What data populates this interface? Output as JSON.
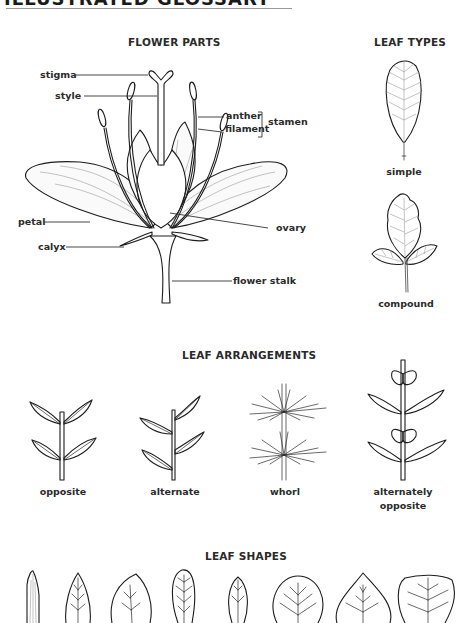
{
  "header": {
    "title": "ILLUSTRATED GLOSSARY"
  },
  "flower_parts": {
    "title": "FLOWER PARTS",
    "labels": {
      "stigma": "stigma",
      "style": "style",
      "anther": "anther",
      "filament": "filament",
      "stamen": "stamen",
      "petal": "petal",
      "ovary": "ovary",
      "calyx": "calyx",
      "flower_stalk": "flower stalk"
    }
  },
  "leaf_types": {
    "title": "LEAF TYPES",
    "items": [
      {
        "label": "simple"
      },
      {
        "label": "compound"
      }
    ]
  },
  "leaf_arrangements": {
    "title": "LEAF ARRANGEMENTS",
    "items": [
      {
        "label": "opposite"
      },
      {
        "label": "alternate"
      },
      {
        "label": "whorl"
      },
      {
        "label": "alternately",
        "label2": "opposite"
      }
    ]
  },
  "leaf_shapes": {
    "title": "LEAF SHAPES",
    "count_visible": 8
  },
  "colors": {
    "ink": "#1c1c1c",
    "vein": "#9a9a9a",
    "rule": "#9a9a9a",
    "background": "#ffffff"
  }
}
